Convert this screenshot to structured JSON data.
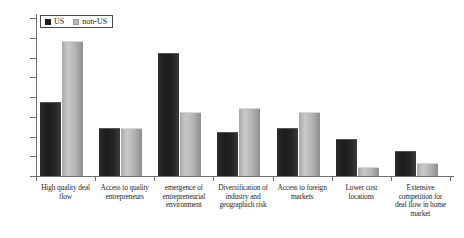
{
  "chart_data": {
    "type": "bar",
    "title": "",
    "xlabel": "",
    "ylabel": "",
    "ylim": [
      0,
      40
    ],
    "ytick_labels": [
      "0%",
      "5%",
      "10%",
      "15%",
      "20%",
      "25%",
      "30%",
      "35%",
      "40%"
    ],
    "ytick_values": [
      0,
      5,
      10,
      15,
      20,
      25,
      30,
      35,
      40
    ],
    "grid": false,
    "legend_position": "top-left",
    "categories": [
      "High quality deal flow",
      "Access to quality entrepreneurs",
      "emergence of entrepreneurial environment",
      "Diversification of industry and geographich risk",
      "Access to foreign markets",
      "Lower cost locations",
      "Extensive competition for deal flow in home market"
    ],
    "category_lines": [
      [
        "High quality deal",
        "flow"
      ],
      [
        "Access to quality",
        "entrepreneurs"
      ],
      [
        "emergence of",
        "entrepreneurial",
        "environment"
      ],
      [
        "Diversification of",
        "industry and",
        "geographich risk"
      ],
      [
        "Access to foreign",
        "markets"
      ],
      [
        "Lower cost",
        "locations"
      ],
      [
        "Extensive",
        "competition for",
        "deal flow in home",
        "market"
      ]
    ],
    "series": [
      {
        "name": "US",
        "color": "#1f1f1f",
        "values": [
          18.5,
          12,
          31,
          11,
          12,
          9,
          6
        ]
      },
      {
        "name": "non-US",
        "color": "#b8b8b8",
        "values": [
          34,
          12,
          16,
          17,
          16,
          2,
          3
        ]
      }
    ]
  },
  "legend": {
    "items": [
      {
        "label": "US",
        "swatch": "us"
      },
      {
        "label": "non-US",
        "swatch": "nonus"
      }
    ]
  }
}
